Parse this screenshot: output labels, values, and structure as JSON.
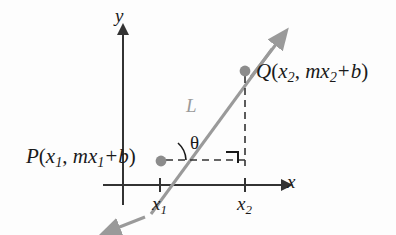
{
  "figure": {
    "kind": "coordinate-diagram",
    "background_color": "#fdfdfd",
    "axis_color": "#333333",
    "line_color": "#9a9a9a",
    "point_color": "#8c8c8c",
    "dash_color": "#333333",
    "text_color": "#1a1a1a"
  },
  "axes": {
    "y_label": "y",
    "x_label": "x"
  },
  "line": {
    "label": "L"
  },
  "angle": {
    "label": "θ"
  },
  "points": {
    "p": {
      "name": "P",
      "open_paren": "(",
      "x_sym": "x",
      "x_sub": "1",
      "comma": ", ",
      "slope_sym": "m",
      "slope_x_sym": "x",
      "slope_x_sub": "1",
      "plus": "+",
      "intercept": "b",
      "close_paren": ")",
      "full_text": "P(x1, mx1 + b)"
    },
    "q": {
      "name": "Q",
      "open_paren": "(",
      "x_sym": "x",
      "x_sub": "2",
      "comma": ", ",
      "slope_sym": "m",
      "slope_x_sym": "x",
      "slope_x_sub": "2",
      "plus": "+",
      "intercept": "b",
      "close_paren": ")",
      "full_text": "Q(x2, mx2 + b)"
    }
  },
  "ticks": {
    "x1": {
      "sym": "x",
      "sub": "1"
    },
    "x2": {
      "sym": "x",
      "sub": "2"
    }
  },
  "markers": {
    "right_angle": "right-angle-square"
  }
}
